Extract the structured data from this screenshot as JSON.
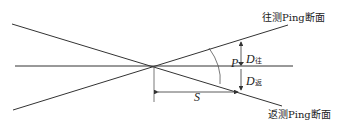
{
  "diagram": {
    "labels": {
      "forward_ping": "往测Ping断面",
      "return_ping": "返测Ping断面"
    },
    "symbols": {
      "P": "P",
      "S": "S",
      "D_forward": "D",
      "D_forward_sub": "往",
      "D_return": "D",
      "D_return_sub": "返"
    },
    "colors": {
      "line": "#333333",
      "background": "#ffffff"
    }
  }
}
